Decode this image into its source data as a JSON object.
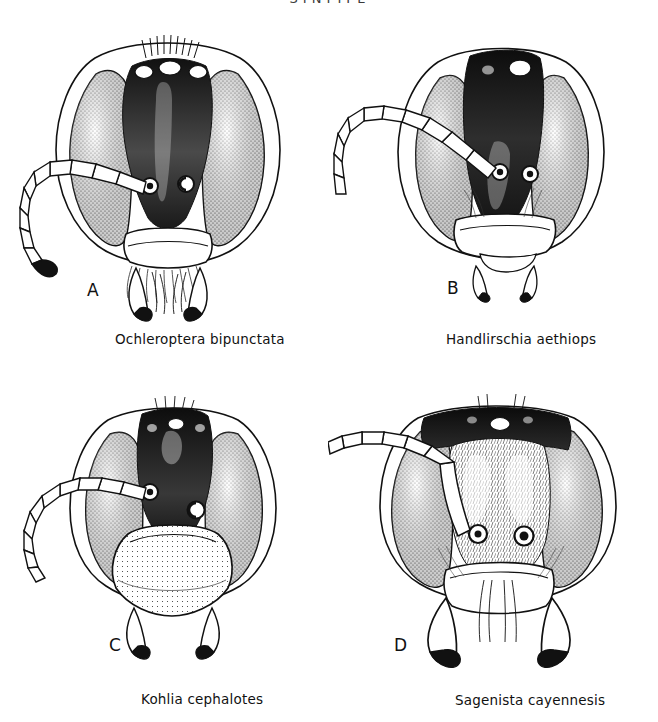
{
  "plate": {
    "header": "SYNTYPE",
    "background_color": "#ffffff",
    "ink_color": "#111111"
  },
  "figures": [
    {
      "letter": "A",
      "caption": "Ochleroptera bipunctata",
      "description": "frontal view of wasp head with dark frons, stippled compound eyes, three ocelli and a long segmented antenna curving to the lower left"
    },
    {
      "letter": "B",
      "caption": "Handlirschia aethiops",
      "description": "frontal view of wasp head with tall dark frons, one prominent pale ocellus, broad stippled eyes and a long upward-arching segmented antenna"
    },
    {
      "letter": "C",
      "caption": "Kohlia cephalotes",
      "description": "frontal view of wasp head with dark upper frons, large rounded pale clypeus, stippled eyes and a segmented antenna sweeping to the left"
    },
    {
      "letter": "D",
      "caption": "Sagenista cayennesis",
      "description": "frontal view of wasp head with dark vertex, hairy pale face, large stippled eyes, heavy curved mandibles and a thick segmented antenna"
    }
  ]
}
